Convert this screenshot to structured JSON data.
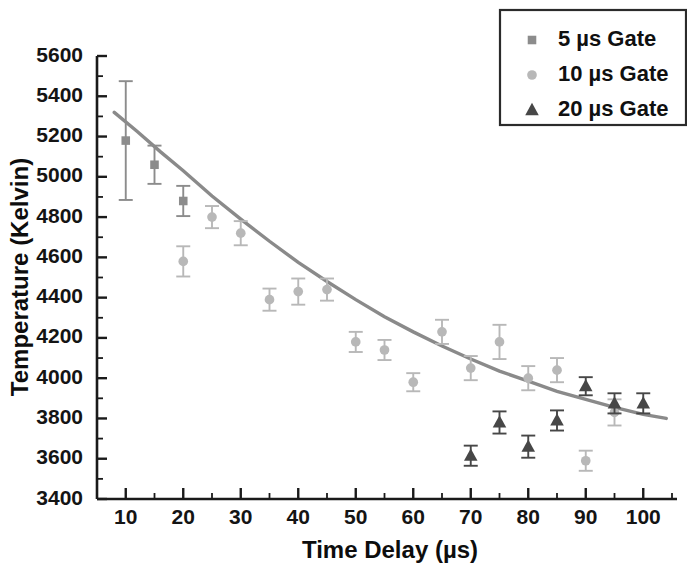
{
  "chart_data": {
    "type": "scatter",
    "title": "",
    "xlabel": "Time Delay (µs)",
    "ylabel": "Temperature (Kelvin)",
    "xlim": [
      5,
      105
    ],
    "ylim": [
      3400,
      5600
    ],
    "xticks": [
      10,
      20,
      30,
      40,
      50,
      60,
      70,
      80,
      90,
      100
    ],
    "yticks": [
      3400,
      3600,
      3800,
      4000,
      4200,
      4400,
      4600,
      4800,
      5000,
      5200,
      5400,
      5600
    ],
    "xtick_labels": [
      "10",
      "20",
      "30",
      "40",
      "50",
      "60",
      "70",
      "80",
      "90",
      "100"
    ],
    "ytick_labels": [
      "3400",
      "3600",
      "3800",
      "4000",
      "4200",
      "4400",
      "4600",
      "4800",
      "5000",
      "5200",
      "5400",
      "5600"
    ],
    "x_minor_tick_step": 5,
    "y_minor_tick_step": 100,
    "grid": false,
    "legend_position": "top-right",
    "error_bars": true,
    "series": [
      {
        "name": "5 µs Gate",
        "marker": "square",
        "color": "#8c8c8c",
        "x": [
          10,
          15,
          20
        ],
        "y": [
          5180,
          5060,
          4880
        ],
        "yerr": [
          295,
          95,
          75
        ]
      },
      {
        "name": "10 µs Gate",
        "marker": "circle",
        "color": "#b8b8b8",
        "x": [
          20,
          25,
          30,
          35,
          40,
          45,
          50,
          55,
          60,
          65,
          70,
          75,
          80,
          85,
          90,
          95
        ],
        "y": [
          4580,
          4800,
          4720,
          4390,
          4430,
          4440,
          4180,
          4140,
          3980,
          4230,
          4050,
          4180,
          4000,
          4040,
          3590,
          3830
        ],
        "yerr": [
          75,
          55,
          60,
          55,
          65,
          55,
          50,
          50,
          45,
          60,
          60,
          85,
          60,
          60,
          50,
          65
        ]
      },
      {
        "name": "20 µs Gate",
        "marker": "triangle",
        "color": "#474747",
        "x": [
          70,
          75,
          80,
          85,
          90,
          95,
          100
        ],
        "y": [
          3615,
          3780,
          3660,
          3790,
          3960,
          3875,
          3875
        ],
        "yerr": [
          50,
          55,
          55,
          50,
          45,
          50,
          50
        ]
      }
    ],
    "fit_curve": {
      "name": "exponential decay fit",
      "color": "#8a8a8a",
      "x": [
        8,
        12,
        16,
        20,
        25,
        30,
        35,
        40,
        45,
        50,
        55,
        60,
        65,
        70,
        75,
        80,
        85,
        90,
        95,
        100,
        104
      ],
      "y": [
        5320,
        5225,
        5125,
        5030,
        4905,
        4790,
        4680,
        4575,
        4480,
        4390,
        4305,
        4230,
        4160,
        4095,
        4035,
        3985,
        3935,
        3895,
        3855,
        3820,
        3800
      ]
    }
  },
  "legend": {
    "entries": [
      {
        "label": "5 µs Gate",
        "marker": "square"
      },
      {
        "label": "10 µs Gate",
        "marker": "circle"
      },
      {
        "label": "20 µs Gate",
        "marker": "triangle"
      }
    ]
  }
}
